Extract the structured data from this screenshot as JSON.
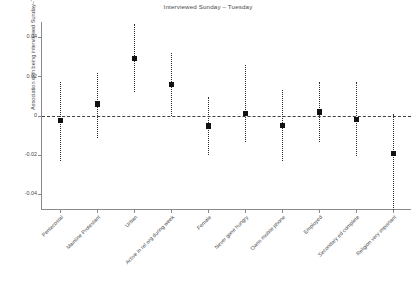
{
  "chart_data": {
    "type": "scatter",
    "title": "Interviewed Sunday – Tuesday",
    "xlabel": "",
    "ylabel": "Association with being interviewed Sunday–Tuesday",
    "ylim": [
      -0.048,
      0.048
    ],
    "yticks": [
      0.04,
      0.02,
      0,
      -0.02,
      -0.04
    ],
    "ytick_labels": [
      "0.04",
      "0.02",
      "0",
      "-0.02",
      "-0.04"
    ],
    "grid": false,
    "legend": "none",
    "reference_line": {
      "value": 0,
      "style": "dashed",
      "color": "#3f3f3f"
    },
    "marker_style": "filled-square",
    "errorbar_style": "dotted-vertical",
    "categories": [
      "Pentecostal",
      "Mainline Protestant",
      "Urban",
      "Active in rel org during week",
      "Female",
      "Never gone hungry",
      "Owns mobile phone",
      "Employed",
      "Secondary ed complete",
      "Religion very important"
    ],
    "values": [
      -0.0022,
      0.0061,
      0.0295,
      0.0161,
      -0.0052,
      0.0013,
      -0.0048,
      0.0021,
      -0.0018,
      -0.019
    ],
    "ci_low": [
      -0.0232,
      -0.011,
      0.0122,
      0.0001,
      -0.0198,
      -0.0135,
      -0.0228,
      -0.0134,
      -0.0204,
      -0.0478
    ],
    "ci_high": [
      0.0172,
      0.0222,
      0.047,
      0.0322,
      0.0098,
      0.0262,
      0.0134,
      0.0176,
      0.0172,
      0.001
    ]
  }
}
